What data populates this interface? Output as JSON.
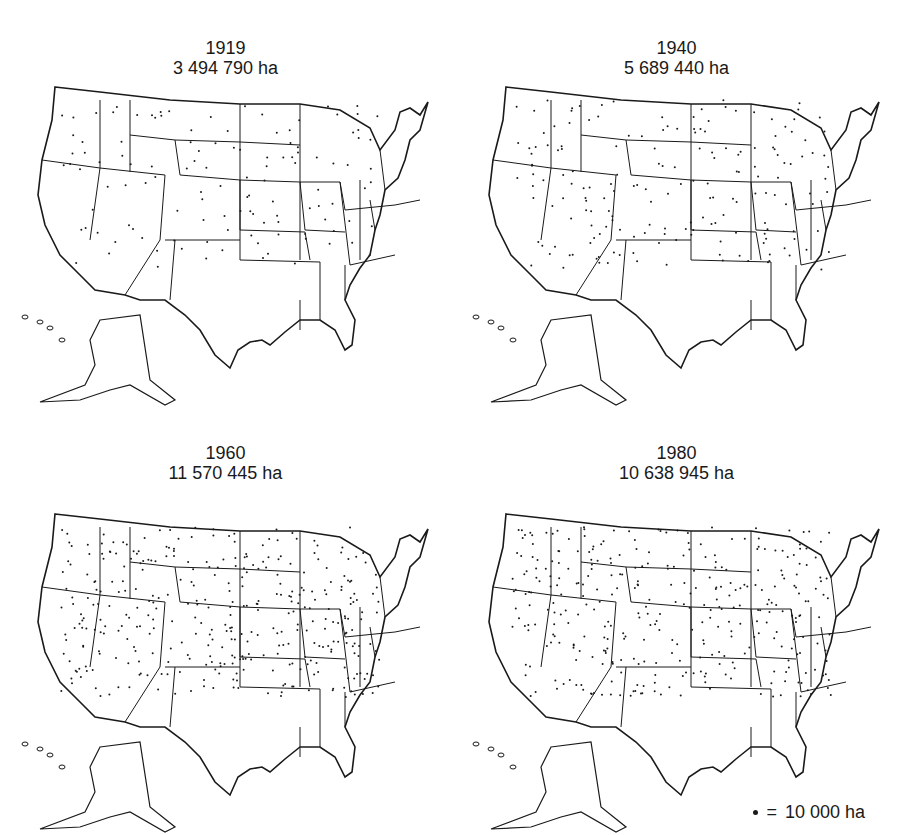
{
  "maps": [
    {
      "year": "1919",
      "area": "3 494 790 ha",
      "density": 0.6
    },
    {
      "year": "1940",
      "area": "5 689 440 ha",
      "density": 0.9
    },
    {
      "year": "1960",
      "area": "11 570 445 ha",
      "density": 1.8
    },
    {
      "year": "1980",
      "area": "10 638 945 ha",
      "density": 1.7
    }
  ],
  "legend": {
    "symbol": "•",
    "equals": "=",
    "label": "10 000 ha"
  }
}
